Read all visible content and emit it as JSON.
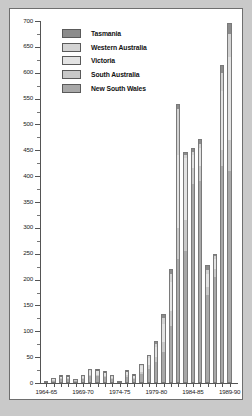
{
  "chart_data": {
    "type": "bar",
    "subtype": "stacked-vertical",
    "title": "",
    "xlabel": "",
    "ylabel": "",
    "ylim": [
      0,
      700
    ],
    "ytick_step": 50,
    "yticks": [
      0,
      50,
      100,
      150,
      200,
      250,
      300,
      350,
      400,
      450,
      500,
      550,
      600,
      650,
      700
    ],
    "ytick_labels": [
      "0",
      "50",
      "100",
      "150",
      "200",
      "250",
      "300",
      "350",
      "400",
      "450",
      "500",
      "550",
      "600",
      "650",
      "700"
    ],
    "grid": false,
    "legend_position": "top-left",
    "categories": [
      "1964-65",
      "1965-66",
      "1966-67",
      "1967-68",
      "1968-69",
      "1969-70",
      "1970-71",
      "1971-72",
      "1972-73",
      "1973-74",
      "1974-75",
      "1975-76",
      "1976-77",
      "1977-78",
      "1978-79",
      "1979-80",
      "1980-81",
      "1981-82",
      "1982-83",
      "1983-84",
      "1984-85",
      "1985-86",
      "1986-87",
      "1987-88",
      "1988-89",
      "1989-90"
    ],
    "xtick_labels": [
      "1964-65",
      "1969-70",
      "1974-75",
      "1979-80",
      "1984-85",
      "1989-90"
    ],
    "xtick_categories": [
      "1964-65",
      "1969-70",
      "1974-75",
      "1979-80",
      "1984-85",
      "1989-90"
    ],
    "series": [
      {
        "name": "New South Wales",
        "color": "#a8a8a8",
        "values": [
          2,
          5,
          8,
          8,
          4,
          7,
          14,
          13,
          12,
          8,
          2,
          12,
          8,
          18,
          28,
          40,
          60,
          110,
          240,
          255,
          385,
          390,
          170,
          205,
          420,
          410
        ]
      },
      {
        "name": "South Australia",
        "color": "#c9c9c9",
        "values": [
          0,
          1,
          1,
          1,
          1,
          2,
          2,
          3,
          2,
          1,
          1,
          3,
          2,
          4,
          6,
          10,
          20,
          30,
          60,
          60,
          30,
          30,
          15,
          15,
          30,
          60
        ]
      },
      {
        "name": "Victoria",
        "color": "#e3e3e3",
        "values": [
          1,
          2,
          3,
          3,
          2,
          4,
          8,
          7,
          6,
          4,
          1,
          6,
          4,
          10,
          14,
          20,
          34,
          55,
          140,
          120,
          25,
          35,
          25,
          20,
          115,
          160
        ]
      },
      {
        "name": "Western Australia",
        "color": "#d3d3d3",
        "values": [
          0,
          1,
          1,
          1,
          1,
          1,
          2,
          2,
          1,
          1,
          0,
          2,
          1,
          3,
          4,
          6,
          12,
          16,
          90,
          6,
          6,
          8,
          8,
          5,
          35,
          45
        ]
      },
      {
        "name": "Tasmania",
        "color": "#8c8c8c",
        "values": [
          0,
          0,
          1,
          1,
          0,
          1,
          2,
          1,
          1,
          1,
          0,
          1,
          1,
          2,
          3,
          5,
          8,
          10,
          10,
          6,
          8,
          8,
          10,
          5,
          15,
          22
        ]
      }
    ],
    "totals": [
      3,
      9,
      14,
      14,
      8,
      15,
      28,
      26,
      22,
      15,
      4,
      24,
      16,
      37,
      55,
      81,
      134,
      221,
      540,
      447,
      454,
      471,
      228,
      250,
      615,
      697
    ]
  },
  "legend": {
    "items": [
      {
        "label": "Tasmania",
        "color": "#8c8c8c"
      },
      {
        "label": "Western Australia",
        "color": "#d3d3d3"
      },
      {
        "label": "Victoria",
        "color": "#e3e3e3"
      },
      {
        "label": "South Australia",
        "color": "#c9c9c9"
      },
      {
        "label": "New South Wales",
        "color": "#a8a8a8"
      }
    ]
  },
  "figure": {
    "background_color": "#c9c9c9",
    "panel_color": "#ffffff",
    "border_color": "#6e6e6e",
    "axis_color": "#555555"
  }
}
